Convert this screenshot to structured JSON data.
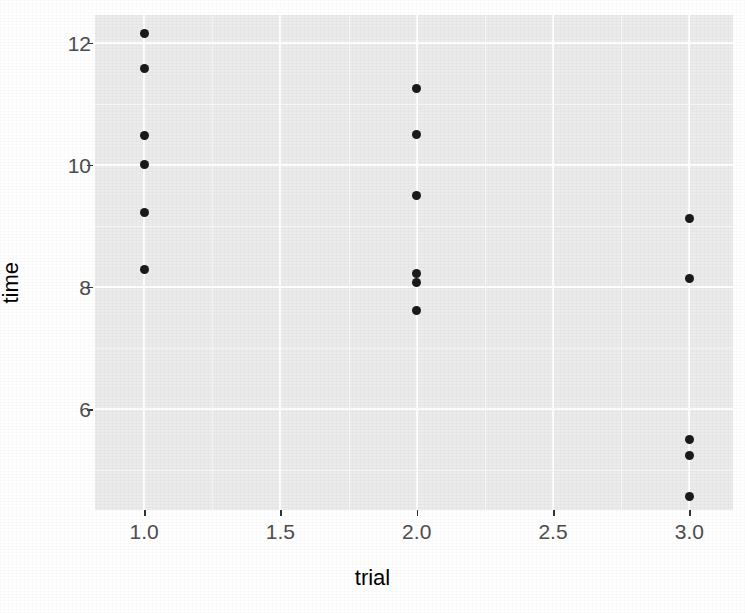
{
  "chart_data": {
    "type": "scatter",
    "title": "",
    "xlabel": "trial",
    "ylabel": "time",
    "xlim": [
      0.82,
      3.16
    ],
    "ylim": [
      4.35,
      12.45
    ],
    "grid": true,
    "legend": "none",
    "x_ticks": [
      {
        "value": 1.0,
        "label": "1.0"
      },
      {
        "value": 1.5,
        "label": "1.5"
      },
      {
        "value": 2.0,
        "label": "2.0"
      },
      {
        "value": 2.5,
        "label": "2.5"
      },
      {
        "value": 3.0,
        "label": "3.0"
      }
    ],
    "y_ticks": [
      {
        "value": 12,
        "label": "12"
      },
      {
        "value": 10,
        "label": "10"
      },
      {
        "value": 8,
        "label": "8"
      },
      {
        "value": 6,
        "label": "6"
      }
    ],
    "x_minor_ticks": [
      1.25,
      1.75,
      2.25,
      2.75
    ],
    "y_minor_ticks": [
      11,
      9,
      7,
      5
    ],
    "point_color": "#1a1a1a",
    "panel_background": "#ebebeb",
    "gridline_color": "#ffffff",
    "points": [
      {
        "trial": 1,
        "time": 12.15
      },
      {
        "trial": 1,
        "time": 11.58
      },
      {
        "trial": 1,
        "time": 10.48
      },
      {
        "trial": 1,
        "time": 10.0
      },
      {
        "trial": 1,
        "time": 9.22
      },
      {
        "trial": 1,
        "time": 8.28
      },
      {
        "trial": 2,
        "time": 11.24
      },
      {
        "trial": 2,
        "time": 10.5
      },
      {
        "trial": 2,
        "time": 9.5
      },
      {
        "trial": 2,
        "time": 8.22
      },
      {
        "trial": 2,
        "time": 8.08
      },
      {
        "trial": 2,
        "time": 7.62
      },
      {
        "trial": 3,
        "time": 9.12
      },
      {
        "trial": 3,
        "time": 8.14
      },
      {
        "trial": 3,
        "time": 5.51
      },
      {
        "trial": 3,
        "time": 5.25
      },
      {
        "trial": 3,
        "time": 4.57
      }
    ]
  }
}
